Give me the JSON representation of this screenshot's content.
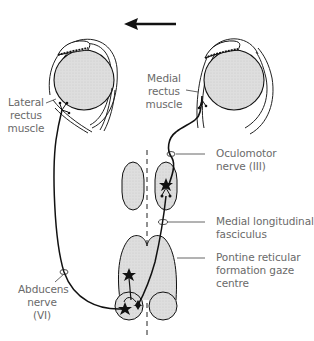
{
  "diagram": {
    "direction_arrow": "left",
    "labels": {
      "lateral_rectus": "Lateral\nrectus\nmuscle",
      "medial_rectus": "Medial\nrectus\nmuscle",
      "oculomotor": "Oculomotor\nnerve (III)",
      "mlf": "Medial longitudinal\nfasciculus",
      "pprf": "Pontine reticular\nformation gaze\ncentre",
      "abducens": "Abducens\nnerve\n(VI)"
    },
    "colors": {
      "line": "#1a1a1a",
      "fill": "#dcdcdc",
      "label_text": "#6a6a6a",
      "leader_line": "#555555"
    }
  }
}
